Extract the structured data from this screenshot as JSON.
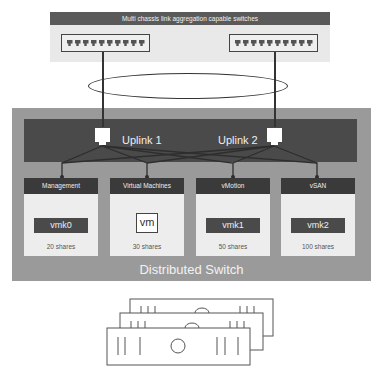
{
  "top_panel": {
    "title": "Multi chassis link aggregation capable switches",
    "switches": [
      {
        "name": "physical-switch-1",
        "ports": 10
      },
      {
        "name": "physical-switch-2",
        "ports": 10
      }
    ]
  },
  "uplinks": [
    {
      "label": "Uplink 1"
    },
    {
      "label": "Uplink 2"
    }
  ],
  "port_groups": [
    {
      "name": "Management",
      "adapter": "vmk0",
      "shares": "20 shares",
      "type": "vmkernel"
    },
    {
      "name": "Virtual Machines",
      "adapter": "vm",
      "shares": "30 shares",
      "type": "vm"
    },
    {
      "name": "vMotion",
      "adapter": "vmk1",
      "shares": "50 shares",
      "type": "vmkernel"
    },
    {
      "name": "vSAN",
      "adapter": "vmk2",
      "shares": "100 shares",
      "type": "vmkernel"
    }
  ],
  "distributed_switch": {
    "label": "Distributed Switch"
  },
  "hosts": {
    "count": 3,
    "icon": "server-stack-icon"
  },
  "colors": {
    "panel_dark": "#4a4a4a",
    "header_dark": "#3a3a3a",
    "ds_gray": "#9a9a9a",
    "light_panel": "#ededed"
  }
}
